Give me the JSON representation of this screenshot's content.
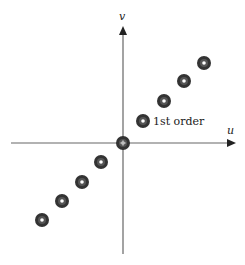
{
  "diagram": {
    "axes": {
      "x_label": "u",
      "y_label": "v",
      "origin": [
        123,
        143
      ],
      "x_range": [
        11,
        236
      ],
      "y_range": [
        8,
        254
      ]
    },
    "annotation": "1st order",
    "colors": {
      "axis": "#666666",
      "dot_outer": "#333333",
      "dot_ring": "#555555",
      "dot_center": "#ffffff"
    },
    "dots": [
      {
        "x": 42,
        "y": 220,
        "order": -4
      },
      {
        "x": 62,
        "y": 201,
        "order": -3
      },
      {
        "x": 82,
        "y": 182,
        "order": -2
      },
      {
        "x": 101,
        "y": 162,
        "order": -1
      },
      {
        "x": 123,
        "y": 143,
        "order": 0
      },
      {
        "x": 143,
        "y": 121,
        "order": 1
      },
      {
        "x": 164,
        "y": 101,
        "order": 2
      },
      {
        "x": 184,
        "y": 81,
        "order": 3
      },
      {
        "x": 204,
        "y": 63,
        "order": 4
      }
    ]
  }
}
